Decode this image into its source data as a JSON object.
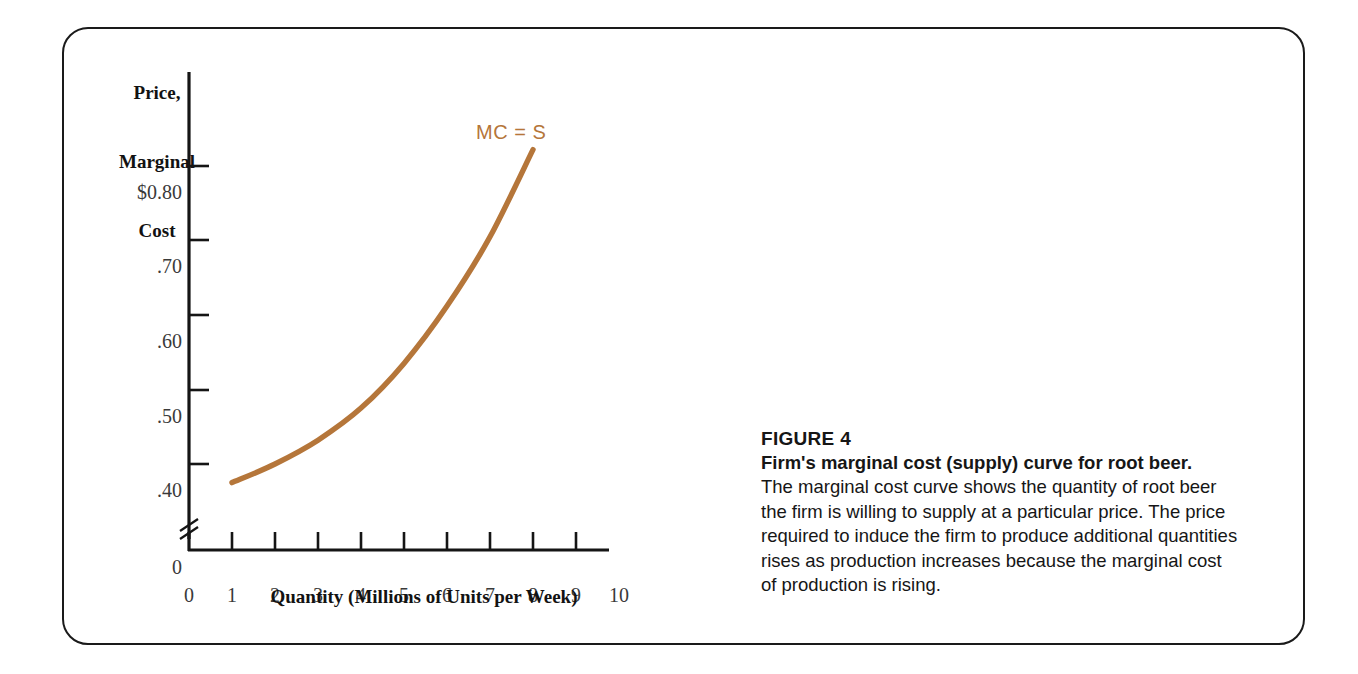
{
  "figure": {
    "number_label": "FIGURE 4",
    "title": "Firm's marginal cost (supply) curve for root beer.",
    "body": "The marginal cost curve shows the quantity of root beer the firm is willing to supply at a particular price. The price required to induce the firm to produce additional quantities rises as production increases because the marginal cost of production is rising."
  },
  "chart_data": {
    "type": "line",
    "title": "",
    "xlabel": "Quantity (Millions of Units per Week)",
    "ylabel": "Price,\nMarginal\nCost",
    "ylabel_lines": [
      "Price,",
      "Marginal",
      "Cost"
    ],
    "curve_label": "MC = S",
    "curve_color": "#b5763a",
    "axis_color": "#151515",
    "grid": false,
    "legend": "inline-label",
    "axis_break_y": true,
    "xlim": [
      0,
      10
    ],
    "ylim": [
      0.3,
      0.85
    ],
    "x_tick_values": [
      0,
      1,
      2,
      3,
      4,
      5,
      6,
      7,
      8,
      9,
      10
    ],
    "x_tick_labels": [
      "0",
      "1",
      "2",
      "3",
      "4",
      "5",
      "6",
      "7",
      "8",
      "9",
      "10"
    ],
    "y_tick_values": [
      0.4,
      0.5,
      0.6,
      0.7,
      0.8
    ],
    "y_tick_labels": [
      ".40",
      ".50",
      ".60",
      ".70",
      "$0.80"
    ],
    "y_origin_label": "0",
    "x": [
      1,
      2,
      3,
      4,
      5,
      6,
      7,
      8
    ],
    "values": [
      0.375,
      0.4,
      0.432,
      0.475,
      0.535,
      0.612,
      0.705,
      0.822
    ],
    "series": [
      {
        "name": "MC = S",
        "x": [
          1,
          2,
          3,
          4,
          5,
          6,
          7,
          8
        ],
        "values": [
          0.375,
          0.4,
          0.432,
          0.475,
          0.535,
          0.612,
          0.705,
          0.822
        ]
      }
    ]
  }
}
